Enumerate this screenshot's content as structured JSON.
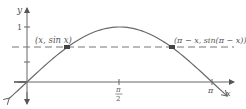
{
  "diagram": {
    "axes": {
      "x_label": "x",
      "y_label": "y",
      "y_tick_label": "1",
      "x_tick_labels": {
        "half_pi_num": "π",
        "half_pi_den": "2",
        "pi": "π"
      }
    },
    "points": [
      {
        "label": "(x, sin x)"
      },
      {
        "label": "(π − x, sin(π − x))"
      }
    ],
    "colors": {
      "curve": "#6a6a6a",
      "axis": "#555555",
      "dashed": "#777777",
      "point": "#444444"
    }
  }
}
